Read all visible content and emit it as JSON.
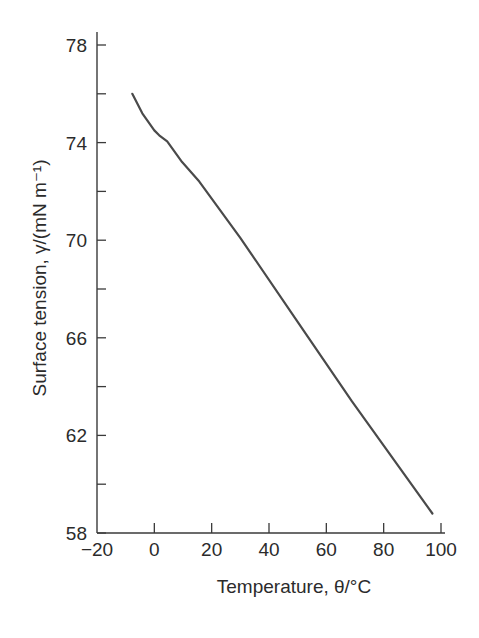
{
  "chart_data": {
    "type": "line",
    "title": "",
    "xlabel": "Temperature, θ/°C",
    "ylabel": "Surface tension, γ/(mN m⁻¹)",
    "xlim": [
      -20,
      100
    ],
    "ylim": [
      58,
      78
    ],
    "x_ticks": [
      -20,
      0,
      20,
      40,
      60,
      80,
      100
    ],
    "x_tick_labels": [
      "−20",
      "0",
      "20",
      "40",
      "60",
      "80",
      "100"
    ],
    "y_ticks": [
      58,
      60,
      62,
      64,
      66,
      68,
      70,
      72,
      74,
      76,
      78
    ],
    "y_tick_labels": [
      "58",
      "",
      "62",
      "",
      "66",
      "",
      "70",
      "",
      "74",
      "",
      "78"
    ],
    "grid": false,
    "legend": null,
    "series": [
      {
        "name": "Water surface tension",
        "color": "#4a4a4a",
        "x": [
          -7.7,
          -4.2,
          0,
          1.7,
          4.5,
          9.7,
          15.7,
          30,
          49.7,
          68.9,
          97
        ],
        "y": [
          76.0,
          75.2,
          74.5,
          74.3,
          74.05,
          73.2,
          72.4,
          70.1,
          66.7,
          63.4,
          58.8
        ]
      }
    ]
  },
  "colors": {
    "axis": "#3a3a3a",
    "line": "#4a4a4a",
    "text": "#2b2b2b",
    "background": "#ffffff"
  }
}
